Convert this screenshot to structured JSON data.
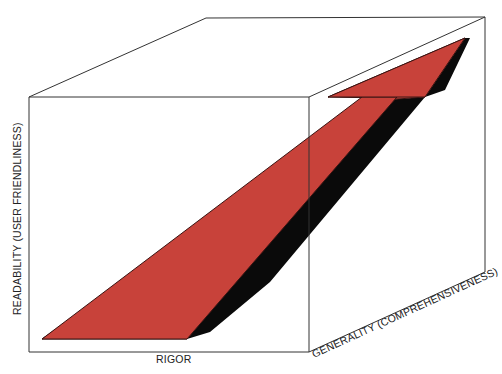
{
  "diagram": {
    "type": "3d-cube-arrow",
    "axes": {
      "x_label": "RIGOR",
      "y_label": "READABILITY (USER FRIENDLINESS)",
      "z_label": "GENERALITY (COMPREHENSIVENESS)"
    },
    "colors": {
      "arrow_fill": "#c8423a",
      "arrow_shadow": "#0a0a0a",
      "cube_edge": "#333333",
      "background": "#ffffff"
    }
  }
}
